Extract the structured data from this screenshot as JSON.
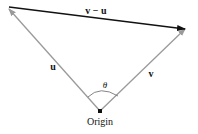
{
  "diagram": {
    "type": "vector-triangle",
    "origin": {
      "label": "Origin",
      "x": 100,
      "y": 111
    },
    "vectors": [
      {
        "name": "u",
        "label": "u",
        "from": [
          100,
          111
        ],
        "to": [
          8,
          8
        ],
        "color": "#9a9a9a"
      },
      {
        "name": "v",
        "label": "v",
        "from": [
          100,
          111
        ],
        "to": [
          186,
          28
        ],
        "color": "#9a9a9a"
      },
      {
        "name": "v-u",
        "label": "v − u",
        "from": [
          8,
          8
        ],
        "to": [
          186,
          28
        ],
        "color": "#111111"
      }
    ],
    "angle": {
      "label": "θ",
      "between": [
        "u",
        "v"
      ]
    }
  }
}
